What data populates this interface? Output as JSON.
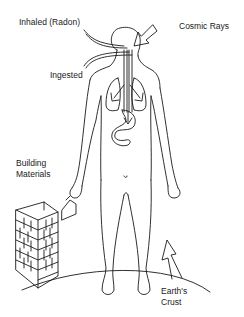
{
  "diagram": {
    "labels": {
      "inhaled": "Inhaled (Radon)",
      "cosmic": "Cosmic Rays",
      "ingested": "Ingested",
      "building_line1": "Building",
      "building_line2": "Materials",
      "earth_line1": "Earth's",
      "earth_line2": "Crust"
    },
    "colors": {
      "line": "#1a1a1a",
      "background": "#ffffff"
    }
  }
}
